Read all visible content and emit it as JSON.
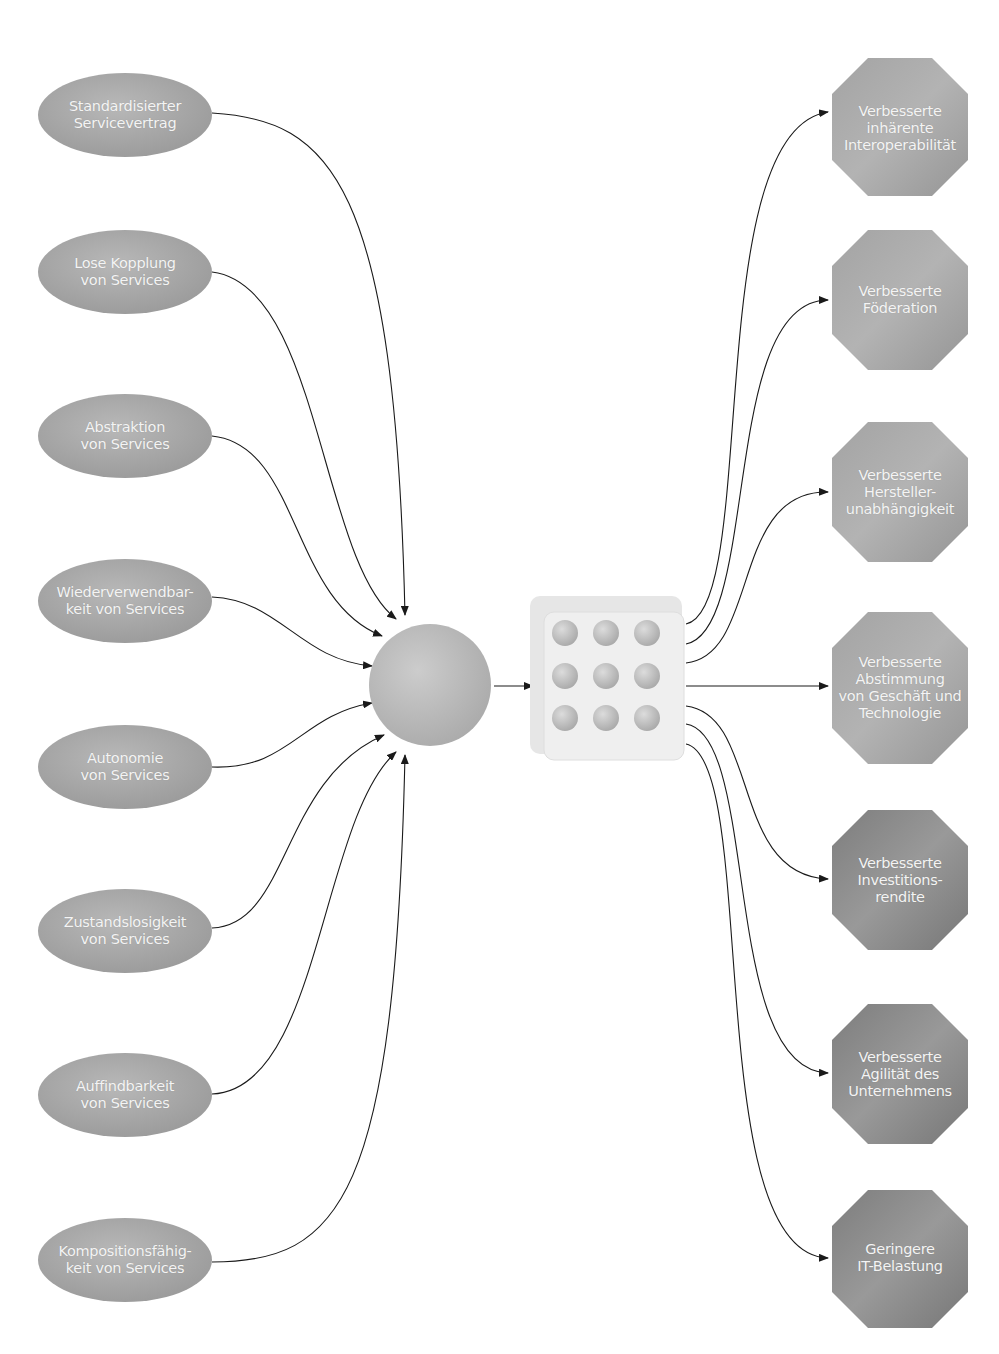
{
  "inputs": [
    {
      "lines": [
        "Standardisierter",
        "Servicevertrag"
      ],
      "cx": 125,
      "cy": 115
    },
    {
      "lines": [
        "Lose Kopplung",
        "von Services"
      ],
      "cx": 125,
      "cy": 272
    },
    {
      "lines": [
        "Abstraktion",
        "von Services"
      ],
      "cx": 125,
      "cy": 436
    },
    {
      "lines": [
        "Wiederverwendbar-",
        "keit von Services"
      ],
      "cx": 125,
      "cy": 601
    },
    {
      "lines": [
        "Autonomie",
        "von Services"
      ],
      "cx": 125,
      "cy": 767
    },
    {
      "lines": [
        "Zustandslosigkeit",
        "von Services"
      ],
      "cx": 125,
      "cy": 931
    },
    {
      "lines": [
        "Auffindbarkeit",
        "von Services"
      ],
      "cx": 125,
      "cy": 1095
    },
    {
      "lines": [
        "Kompositionsfähig-",
        "keit von Services"
      ],
      "cx": 125,
      "cy": 1260
    }
  ],
  "center_sphere": {
    "label": "sphere-icon",
    "cx": 430,
    "cy": 685,
    "r": 60
  },
  "center_grid": {
    "label": "service-grid-icon",
    "rows": 3,
    "cols": 3
  },
  "outcomes": [
    {
      "lines": [
        "Verbesserte",
        "inhärente",
        "Interoperabilität"
      ],
      "cy": 128,
      "shade": "#9d9d9d"
    },
    {
      "lines": [
        "Verbesserte",
        "Föderation"
      ],
      "cy": 300,
      "shade": "#a0a0a0"
    },
    {
      "lines": [
        "Verbesserte",
        "Hersteller-",
        "unabhängigkeit"
      ],
      "cy": 492,
      "shade": "#9c9c9c"
    },
    {
      "lines": [
        "Verbesserte",
        "Abstimmung",
        "von Geschäft und",
        "Technologie"
      ],
      "cy": 688,
      "shade": "#a1a1a1"
    },
    {
      "lines": [
        "Verbesserte",
        "Investitions-",
        "rendite"
      ],
      "cy": 880,
      "shade": "#898989"
    },
    {
      "lines": [
        "Verbesserte",
        "Agilität des",
        "Unternehmens"
      ],
      "cy": 1074,
      "shade": "#868686"
    },
    {
      "lines": [
        "Geringere",
        "IT-Belastung"
      ],
      "cy": 1258,
      "shade": "#858585"
    }
  ],
  "colors": {
    "ellipse": "#a6a6a6",
    "sphere": "#bdbdbd",
    "grid_bg": "#ececec",
    "grid_dot": "#c6c6c6",
    "line": "#1a1a1a"
  }
}
